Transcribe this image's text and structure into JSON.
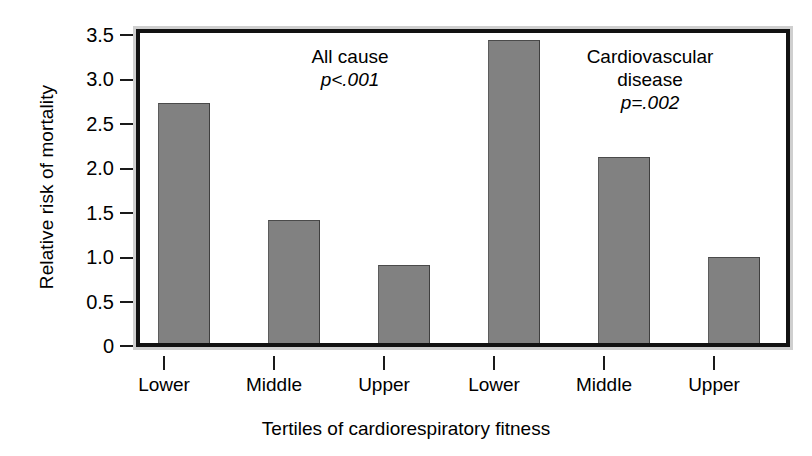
{
  "chart_data": {
    "type": "bar",
    "title": "",
    "xlabel": "Tertiles of cardiorespiratory fitness",
    "ylabel": "Relative risk of mortality",
    "categories": [
      "Lower",
      "Middle",
      "Upper",
      "Lower",
      "Middle",
      "Upper"
    ],
    "values": [
      2.7,
      1.39,
      0.88,
      3.41,
      2.09,
      0.97
    ],
    "ylim": [
      0,
      3.5
    ],
    "ytick_values": [
      0,
      0.5,
      1.0,
      1.5,
      2.0,
      2.5,
      3.0,
      3.5
    ],
    "ytick_labels": [
      "0",
      "0.5",
      "1.0",
      "1.5",
      "2.0",
      "2.5",
      "3.0",
      "3.5"
    ],
    "grid": false,
    "legend": "none",
    "bar_color": "#818181",
    "groups": [
      {
        "name": "All cause",
        "p_label": "p<.001",
        "p_symbol": "p",
        "p_value_text": "<.001",
        "categories": [
          "Lower",
          "Middle",
          "Upper"
        ],
        "values": [
          2.7,
          1.39,
          0.88
        ]
      },
      {
        "name": "Cardiovascular disease",
        "p_label": "p=.002",
        "p_symbol": "p",
        "p_value_text": "=.002",
        "categories": [
          "Lower",
          "Middle",
          "Upper"
        ],
        "values": [
          3.41,
          2.09,
          0.97
        ]
      }
    ],
    "annotations": [
      {
        "line1": "All cause",
        "line2": "",
        "p_symbol": "p",
        "p_text": "<.001"
      },
      {
        "line1": "Cardiovascular",
        "line2": "disease",
        "p_symbol": "p",
        "p_text": "=.002"
      }
    ]
  },
  "axes": {
    "y_title": "Relative risk of mortality",
    "x_title": "Tertiles of cardiorespiratory fitness",
    "y_ticks": [
      "3.5",
      "3.0",
      "2.5",
      "2.0",
      "1.5",
      "1.0",
      "0.5",
      "0"
    ],
    "x_ticks": [
      "Lower",
      "Middle",
      "Upper",
      "Lower",
      "Middle",
      "Upper"
    ]
  },
  "colors": {
    "bar": "#818181",
    "frame_outer": "#cfcfcf",
    "frame_inner": "#121212",
    "text": "#000000",
    "plot_background": "#ffffff"
  }
}
